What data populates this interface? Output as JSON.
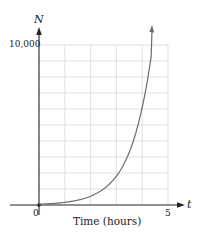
{
  "chart_data": {
    "type": "line",
    "title": "",
    "xlabel": "Time (hours)",
    "ylabel": "N",
    "x_axis_var": "t",
    "xlim": [
      0,
      5
    ],
    "ylim": [
      0,
      10000
    ],
    "x_ticks": [
      "0",
      "5"
    ],
    "y_ticks": [
      "10,000"
    ],
    "grid": true,
    "grid_x_step": 1,
    "grid_y_step": 1000,
    "legend": null,
    "series": [
      {
        "name": "N(t)",
        "description": "exponential growth curve with arrowhead at top",
        "x": [
          0,
          0.5,
          1,
          1.5,
          2,
          2.5,
          3,
          3.5,
          4,
          4.35
        ],
        "values": [
          50,
          90,
          165,
          300,
          550,
          1000,
          1800,
          3300,
          6100,
          9300
        ]
      }
    ],
    "colors": {
      "axis": "#222222",
      "grid": "#d8d8d8",
      "curve": "#6a6a6a"
    }
  },
  "labels": {
    "y_axis": "N",
    "x_axis": "t",
    "y_max": "10,000",
    "origin": "0",
    "x_max": "5",
    "x_title": "Time (hours)"
  }
}
